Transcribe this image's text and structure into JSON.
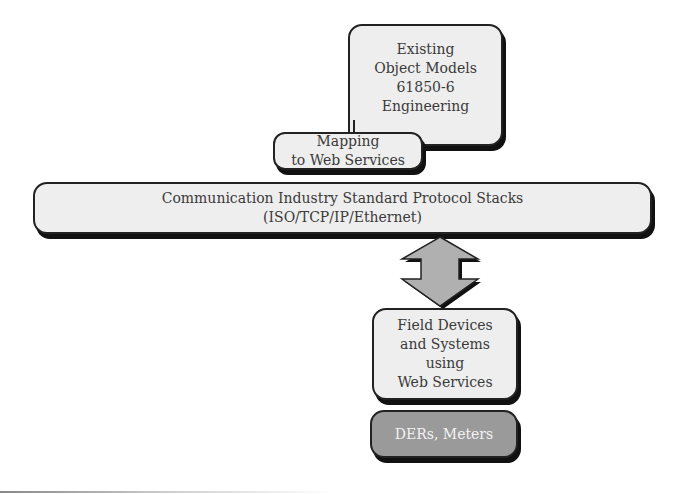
{
  "diagram": {
    "boxes": {
      "object_models": {
        "label": "Existing\nObject Models\n61850-6\nEngineering"
      },
      "mapping": {
        "label": "Mapping\nto Web Services"
      },
      "protocol_stacks": {
        "label": "Communication Industry Standard Protocol Stacks\n(ISO/TCP/IP/Ethernet)"
      },
      "field_devices": {
        "label": "Field Devices\nand Systems\nusing\nWeb Services"
      },
      "ders_meters": {
        "label": "DERs, Meters"
      }
    },
    "arrow": {
      "type": "bidirectional-vertical",
      "fill": "#b0b0b0"
    },
    "colors": {
      "box_fill": "#eeeeee",
      "dark_box_fill": "#9a9a9a",
      "border": "#222222",
      "shadow": "#111111"
    }
  }
}
